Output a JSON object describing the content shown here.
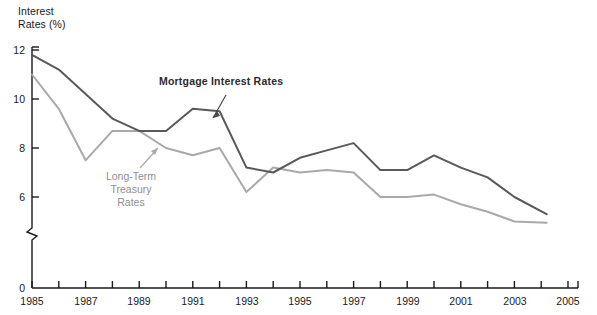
{
  "chart_data": {
    "type": "line",
    "title": "",
    "ylabel": "Interest\nRates (%)",
    "xlabel": "",
    "ylim": [
      0,
      12
    ],
    "y_ticks": [
      0,
      6,
      8,
      10,
      12
    ],
    "y_axis_break": true,
    "y_axis_break_between": [
      0,
      6
    ],
    "xlim": [
      1985,
      2005
    ],
    "x_ticks": [
      1985,
      1986,
      1987,
      1988,
      1989,
      1990,
      1991,
      1992,
      1993,
      1994,
      1995,
      1996,
      1997,
      1998,
      1999,
      2000,
      2001,
      2002,
      2003,
      2004,
      2005
    ],
    "x_tick_labels": [
      "1985",
      "",
      "1987",
      "",
      "1989",
      "",
      "1991",
      "",
      "1993",
      "",
      "1995",
      "",
      "1997",
      "",
      "1999",
      "",
      "2001",
      "",
      "2003",
      "",
      "2005"
    ],
    "grid": false,
    "legend_position": "inline-annotations",
    "x": [
      1985,
      1986,
      1987,
      1988,
      1989,
      1990,
      1991,
      1992,
      1993,
      1994,
      1995,
      1996,
      1997,
      1998,
      1999,
      2000,
      2001,
      2002,
      2003,
      2004.2
    ],
    "series": [
      {
        "name": "Mortgage Interest Rates",
        "color": "#595959",
        "values": [
          11.8,
          11.2,
          10.2,
          9.2,
          8.7,
          8.7,
          9.6,
          9.5,
          7.2,
          7.0,
          7.6,
          7.9,
          8.2,
          7.1,
          7.1,
          7.7,
          7.2,
          6.8,
          6.0,
          5.3
        ]
      },
      {
        "name": "Long-Term Treasury Rates",
        "color": "#a9a9a9",
        "values": [
          11.0,
          9.6,
          7.5,
          8.7,
          8.7,
          8.0,
          7.7,
          8.0,
          6.2,
          7.2,
          7.0,
          7.1,
          7.0,
          6.0,
          6.0,
          6.1,
          5.7,
          5.4,
          5.0,
          4.95
        ]
      }
    ],
    "annotations": [
      {
        "id": "mortgage-annotation",
        "text": "Mortgage Interest Rates",
        "color": "#2b2b2b",
        "bold": true
      },
      {
        "id": "treasury-annotation",
        "text": "Long-Term\nTreasury\nRates",
        "color": "#8e8e8e",
        "bold": false
      }
    ]
  },
  "labels": {
    "y_axis_title_line1": "Interest",
    "y_axis_title_line2": "Rates (%)",
    "y_12": "12",
    "y_10": "10",
    "y_8": "8",
    "y_6": "6",
    "y_0": "0",
    "x_1985": "1985",
    "x_1987": "1987",
    "x_1989": "1989",
    "x_1991": "1991",
    "x_1993": "1993",
    "x_1995": "1995",
    "x_1997": "1997",
    "x_1999": "1999",
    "x_2001": "2001",
    "x_2003": "2003",
    "x_2005": "2005",
    "series_mortgage_l1": "Mortgage Interest Rates",
    "series_treasury_l1": "Long-Term",
    "series_treasury_l2": "Treasury",
    "series_treasury_l3": "Rates"
  },
  "colors": {
    "mortgage_line": "#595959",
    "treasury_line": "#a9a9a9",
    "axis": "#1a1a1a",
    "background": "#ffffff"
  }
}
